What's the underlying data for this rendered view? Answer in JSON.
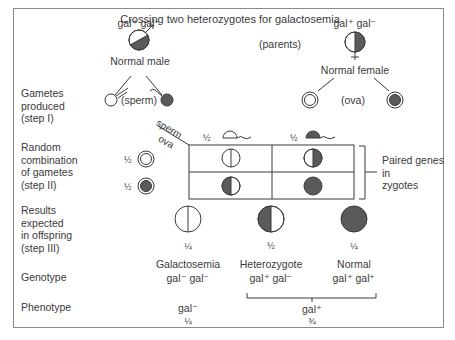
{
  "title": "Crossing two heterozygotes for galactosemia",
  "parents": {
    "label": "(parents)",
    "male": {
      "genotype": "gal⁺ gal⁻",
      "name": "Normal male",
      "symbol": "male-symbol"
    },
    "female": {
      "genotype": "gal⁺ gal⁻",
      "name": "Normal female",
      "symbol": "female-symbol"
    }
  },
  "gametes": {
    "sperm_label": "(sperm)",
    "ova_label": "(ova)"
  },
  "row_labels": {
    "step1": [
      "Gametes",
      "produced",
      "(step I)"
    ],
    "step2": [
      "Random",
      "combination",
      "of gametes",
      "(step II)"
    ],
    "step3": [
      "Results",
      "expected",
      "in offspring",
      "(step III)"
    ],
    "genotype": "Genotype",
    "phenotype": "Phenotype"
  },
  "punnett": {
    "corner_top": "sperm",
    "corner_bottom": "ova",
    "col_fractions": [
      "½",
      "½"
    ],
    "row_fractions": [
      "½",
      "½"
    ],
    "bracket_label": [
      "Paired genes",
      "in",
      "zygotes"
    ]
  },
  "offspring": [
    {
      "fraction": "¼",
      "name": "Galactosemia",
      "genotype": "gal⁻ gal⁻"
    },
    {
      "fraction": "½",
      "name": "Heterozygote",
      "genotype": "gal⁺ gal⁻"
    },
    {
      "fraction": "¼",
      "name": "Normal",
      "genotype": "gal⁺ gal⁺"
    }
  ],
  "phenotypes": [
    {
      "label": "gal⁻",
      "fraction": "¼"
    },
    {
      "label": "gal⁺",
      "fraction": "¾"
    }
  ],
  "colors": {
    "dark_fill": "#5a5a5a",
    "line": "#3a3a3a",
    "frame": "#8a8a8a"
  }
}
